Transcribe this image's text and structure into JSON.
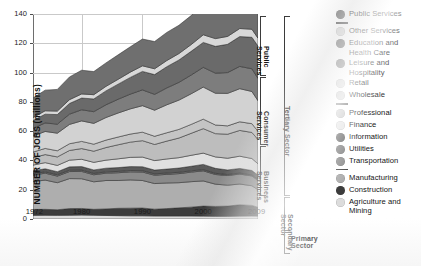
{
  "figure": {
    "kind": "stacked-area-chart"
  },
  "axes": {
    "ylabel": "NUMBER OF JOBS (millions)",
    "yticks": [
      "0",
      "20",
      "40",
      "60",
      "80",
      "100",
      "120",
      "140"
    ],
    "xticks": [
      "1972",
      "1980",
      "1990",
      "2000",
      "2009"
    ]
  },
  "brackets": [
    {
      "label": "Public\nServices",
      "name": "bracket-public-services"
    },
    {
      "label": "Consumer\nServices",
      "name": "bracket-consumer-services"
    },
    {
      "label": "Business\nServices",
      "name": "bracket-business-services"
    },
    {
      "label": "Tertiary Sector",
      "name": "bracket-tertiary-sector"
    },
    {
      "label": "Secondary\nSector",
      "name": "bracket-secondary-sector"
    },
    {
      "label": "Primary\nSector",
      "name": "bracket-primary-sector"
    }
  ],
  "legend": {
    "position": "right",
    "entries": [
      {
        "label": "Public Services",
        "color": "#6f6f6f",
        "sep_after": true
      },
      {
        "label": "Other Services",
        "color": "#d8d8d8",
        "sep_after": false
      },
      {
        "label": "Education and Health Care",
        "color": "#6a6a6a",
        "sep_after": false
      },
      {
        "label": "Leisure and Hospitality",
        "color": "#7d7d7d",
        "sep_after": false
      },
      {
        "label": "Retail",
        "color": "#d2d2d2",
        "sep_after": false
      },
      {
        "label": "Wholesale",
        "color": "#c4c4c4",
        "sep_after": true
      },
      {
        "label": "Professional",
        "color": "#bdbdbd",
        "sep_after": false
      },
      {
        "label": "Finance",
        "color": "#e0e0e0",
        "sep_after": false
      },
      {
        "label": "Information",
        "color": "#5a5a5a",
        "sep_after": false
      },
      {
        "label": "Utilities",
        "color": "#7a7a7a",
        "sep_after": false
      },
      {
        "label": "Transportation",
        "color": "#8a8a8a",
        "sep_after": true
      },
      {
        "label": "Manufacturing",
        "color": "#aeaeae",
        "sep_after": false
      },
      {
        "label": "Construction",
        "color": "#3c3c3c",
        "sep_after": false
      },
      {
        "label": "Agriculture and Mining",
        "color": "#dcdcdc",
        "sep_after": false
      }
    ]
  },
  "chart_data": {
    "type": "area",
    "title": "",
    "xlabel": "",
    "ylabel": "NUMBER OF JOBS (millions)",
    "xlim": [
      1972,
      2009
    ],
    "ylim": [
      0,
      140
    ],
    "grid": true,
    "stacked": true,
    "legend_position": "right",
    "x": [
      1972,
      1974,
      1976,
      1978,
      1980,
      1982,
      1984,
      1986,
      1988,
      1990,
      1992,
      1994,
      1996,
      1998,
      2000,
      2002,
      2004,
      2006,
      2008,
      2009
    ],
    "series": [
      {
        "name": "Agriculture and Mining",
        "color": "#dcdcdc",
        "values": [
          2.5,
          2.6,
          2.5,
          2.6,
          2.7,
          2.6,
          2.4,
          2.3,
          2.2,
          2.2,
          2.1,
          2.1,
          2.1,
          2.1,
          2.0,
          1.9,
          1.9,
          2.0,
          2.1,
          2.0
        ]
      },
      {
        "name": "Construction",
        "color": "#3c3c3c",
        "values": [
          4.0,
          4.0,
          3.8,
          4.5,
          4.5,
          4.0,
          4.5,
          5.0,
          5.2,
          5.3,
          4.6,
          5.0,
          5.5,
          6.0,
          6.8,
          6.7,
          6.9,
          7.7,
          7.2,
          6.0
        ]
      },
      {
        "name": "Manufacturing",
        "color": "#aeaeae",
        "values": [
          19.0,
          20.0,
          18.5,
          20.5,
          20.3,
          18.8,
          19.4,
          19.0,
          19.3,
          18.8,
          17.5,
          17.5,
          17.2,
          17.4,
          17.2,
          15.2,
          14.3,
          14.2,
          13.4,
          12.0
        ]
      },
      {
        "name": "Transportation",
        "color": "#8a8a8a",
        "values": [
          4.5,
          4.7,
          4.5,
          4.8,
          5.0,
          4.8,
          5.0,
          5.3,
          5.5,
          5.8,
          5.7,
          5.9,
          6.2,
          6.5,
          6.9,
          6.6,
          6.6,
          6.8,
          6.7,
          6.3
        ]
      },
      {
        "name": "Utilities",
        "color": "#7a7a7a",
        "values": [
          0.9,
          0.9,
          0.9,
          0.9,
          0.9,
          0.9,
          0.9,
          0.9,
          0.9,
          0.9,
          0.9,
          0.9,
          0.9,
          0.9,
          0.8,
          0.8,
          0.7,
          0.7,
          0.7,
          0.7
        ]
      },
      {
        "name": "Information",
        "color": "#5a5a5a",
        "values": [
          2.0,
          2.1,
          2.1,
          2.3,
          2.4,
          2.4,
          2.5,
          2.6,
          2.7,
          2.7,
          2.6,
          2.7,
          2.9,
          3.1,
          3.6,
          3.4,
          3.1,
          3.1,
          3.0,
          2.9
        ]
      },
      {
        "name": "Finance",
        "color": "#e0e0e0",
        "values": [
          3.9,
          4.2,
          4.3,
          4.6,
          5.0,
          5.2,
          5.5,
          6.0,
          6.3,
          6.6,
          6.5,
          6.9,
          7.1,
          7.5,
          7.7,
          7.8,
          8.0,
          8.4,
          8.2,
          7.8
        ]
      },
      {
        "name": "Professional",
        "color": "#bdbdbd",
        "values": [
          5.0,
          5.5,
          5.8,
          6.6,
          7.3,
          7.6,
          8.6,
          9.6,
          10.4,
          11.2,
          11.0,
          12.2,
          13.4,
          15.0,
          16.7,
          15.9,
          16.4,
          17.6,
          17.8,
          16.6
        ]
      },
      {
        "name": "Wholesale",
        "color": "#c4c4c4",
        "values": [
          3.9,
          4.2,
          4.2,
          4.6,
          4.9,
          4.8,
          5.1,
          5.3,
          5.5,
          5.8,
          5.6,
          5.7,
          5.9,
          6.1,
          6.5,
          5.9,
          5.7,
          5.9,
          6.0,
          5.6
        ]
      },
      {
        "name": "Retail",
        "color": "#d2d2d2",
        "values": [
          10.9,
          11.6,
          12.0,
          13.2,
          14.0,
          14.2,
          15.4,
          16.4,
          17.2,
          18.1,
          17.8,
          19.1,
          20.0,
          20.9,
          21.9,
          21.7,
          22.2,
          22.6,
          22.0,
          20.9
        ]
      },
      {
        "name": "Leisure and Hospitality",
        "color": "#7d7d7d",
        "values": [
          5.3,
          5.8,
          6.2,
          7.0,
          7.6,
          8.0,
          8.7,
          9.4,
          10.1,
          10.8,
          10.8,
          11.5,
          12.1,
          12.8,
          13.5,
          13.7,
          14.2,
          15.2,
          15.5,
          15.2
        ]
      },
      {
        "name": "Education and Health Care",
        "color": "#6a6a6a",
        "values": [
          5.3,
          6.0,
          6.5,
          7.3,
          8.0,
          8.7,
          9.5,
          10.3,
          11.4,
          12.6,
          13.5,
          14.5,
          15.3,
          16.2,
          17.0,
          18.3,
          19.3,
          20.4,
          21.5,
          22.1
        ]
      },
      {
        "name": "Other Services",
        "color": "#d8d8d8",
        "values": [
          2.1,
          2.3,
          2.4,
          2.6,
          2.8,
          2.9,
          3.1,
          3.3,
          3.6,
          3.8,
          4.0,
          4.2,
          4.4,
          4.6,
          5.2,
          5.3,
          5.4,
          5.5,
          5.5,
          5.4
        ]
      },
      {
        "name": "Public Services",
        "color": "#6f6f6f",
        "values": [
          13.3,
          14.1,
          14.8,
          15.5,
          16.2,
          15.8,
          16.0,
          16.7,
          17.3,
          18.3,
          18.6,
          19.2,
          19.3,
          19.8,
          20.8,
          21.5,
          21.6,
          22.0,
          22.5,
          22.5
        ]
      }
    ],
    "totals": [
      82.6,
      88.0,
      88.5,
      97.6,
      101.6,
      100.7,
      105.9,
      111.9,
      117.3,
      122.9,
      120.6,
      126.6,
      132.3,
      138.9,
      146.6,
      144.7,
      146.3,
      152.1,
      152.1,
      145.0
    ]
  }
}
